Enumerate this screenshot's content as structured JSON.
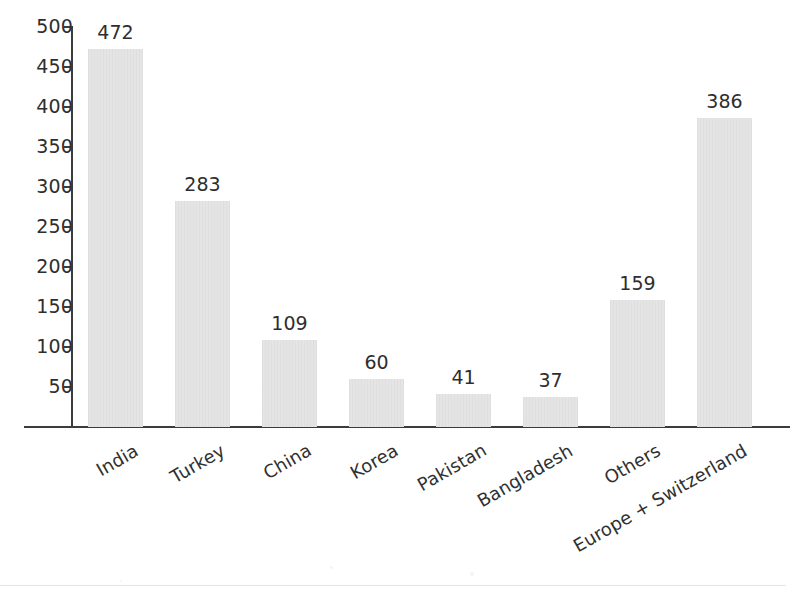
{
  "chart_data": {
    "type": "bar",
    "title": "",
    "subtitle": "",
    "xlabel": "",
    "ylabel": "",
    "categories": [
      "India",
      "Turkey",
      "China",
      "Korea",
      "Pakistan",
      "Bangladesh",
      "Others",
      "Europe + Switzerland"
    ],
    "values": [
      472,
      283,
      109,
      60,
      41,
      37,
      159,
      386
    ],
    "value_labels": [
      "472",
      "283",
      "109",
      "60",
      "41",
      "37",
      "159",
      "386"
    ],
    "ylim": [
      0,
      500
    ],
    "ytick_labels": [
      "500",
      "450",
      "400",
      "350",
      "300",
      "250",
      "200",
      "150",
      "100",
      "50"
    ],
    "ytick_values": [
      500,
      450,
      400,
      350,
      300,
      250,
      200,
      150,
      100,
      50
    ],
    "grid": false,
    "legend": null,
    "legend_position": "none",
    "annotations": [],
    "colors": {
      "bar_fill": "#e3e3e3",
      "axis": "#3c3c3c",
      "text": "#2e2e2e",
      "background": "#ffffff"
    },
    "label_rotation_deg": -30
  }
}
